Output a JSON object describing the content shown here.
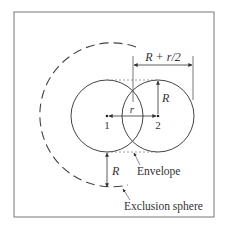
{
  "diagram": {
    "labels": {
      "dimension_top": "R + r/2",
      "radius_right": "R",
      "separation": "r",
      "center1": "1",
      "center2": "2",
      "radius_bottom": "R",
      "envelope": "Envelope",
      "exclusion": "Exclusion sphere"
    },
    "colors": {
      "stroke": "#444444",
      "frame": "#777777",
      "dotted": "#888888"
    }
  }
}
